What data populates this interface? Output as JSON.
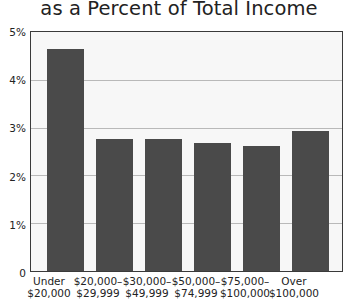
{
  "chart_data": {
    "type": "bar",
    "title": "as a Percent of Total Income",
    "xlabel": "",
    "ylabel": "",
    "categories": [
      "Under\n$20,000",
      "$20,000–\n$29,999",
      "$30,000–\n$49,999",
      "$50,000–\n$74,999",
      "$75,000–\n$100,000",
      "Over\n$100,000"
    ],
    "category_lines": [
      [
        "Under",
        "$20,000"
      ],
      [
        "$20,000–",
        "$29,999"
      ],
      [
        "$30,000–",
        "$49,999"
      ],
      [
        "$50,000–",
        "$74,999"
      ],
      [
        "$75,000–",
        "$100,000"
      ],
      [
        "Over",
        "$100,000"
      ]
    ],
    "values": [
      4.65,
      2.76,
      2.76,
      2.68,
      2.61,
      2.93
    ],
    "ylim": [
      0,
      5
    ],
    "ytick_values": [
      0,
      1,
      2,
      3,
      4,
      5
    ],
    "ytick_labels": [
      "0",
      "1%",
      "2%",
      "3%",
      "4%",
      "5%"
    ],
    "grid": true,
    "grid_axis": "y",
    "legend": false,
    "bar_color": "#4a4a4a",
    "plot_background": "#f7f7f7",
    "frame_color": "#3a3a3a",
    "gridline_color": "#b9b9b9",
    "text_color": "#232323"
  }
}
